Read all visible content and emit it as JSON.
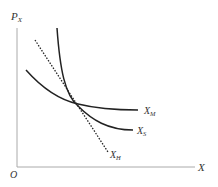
{
  "diagram": {
    "axes": {
      "y_label": "P",
      "y_label_sub": "X",
      "x_label": "X",
      "origin_label": "O"
    },
    "curves": [
      {
        "name": "X_M",
        "label": "X",
        "sub": "M",
        "style": "solid",
        "description": "flatter demand curve"
      },
      {
        "name": "X_S",
        "label": "X",
        "sub": "S",
        "style": "solid",
        "description": "steeper demand curve"
      },
      {
        "name": "X_H",
        "label": "X",
        "sub": "H",
        "style": "dotted",
        "description": "straight dotted line"
      }
    ],
    "colors": {
      "curve": "#222222",
      "axis": "#999999",
      "text": "#333333"
    }
  }
}
